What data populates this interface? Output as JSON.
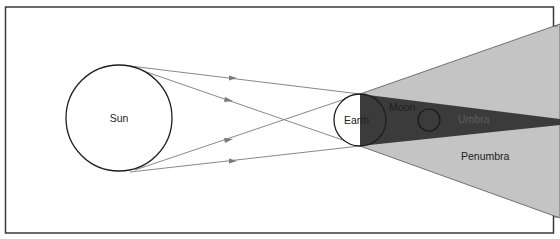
{
  "labels": {
    "sun": "Sun",
    "earth": "Earth",
    "moon": "Moon",
    "umbra": "Umbra",
    "penumbra": "Penumbra"
  },
  "colors": {
    "background": "#ffffff",
    "frame": "#3a3a3a",
    "penumbra_fill": "#c4c4c4",
    "umbra_fill": "#3b3b3b",
    "ray_line": "#7a7a7a",
    "outline": "#1e1e1e",
    "label_text": "#222222",
    "umbra_label_text": "#6a6a6a"
  },
  "geometry": {
    "sun": {
      "cx": 119,
      "cy": 118,
      "r": 53
    },
    "earth": {
      "cx": 360,
      "cy": 120,
      "r": 26
    },
    "moon": {
      "cx": 429,
      "cy": 120,
      "r": 11
    }
  }
}
